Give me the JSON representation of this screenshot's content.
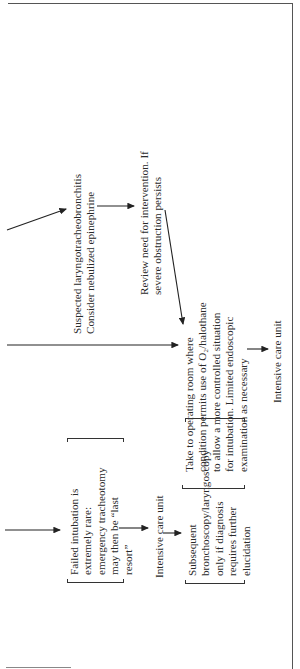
{
  "diagram": {
    "orientation": "rotated-90-ccw",
    "nodes": {
      "laryngo": {
        "lines": [
          "Suspected laryngotracheobronchitis",
          "Consider nebulized epinephrine"
        ]
      },
      "review": {
        "lines": [
          "Review need for intervention. If",
          "severe obstruction persists"
        ]
      },
      "operating_room": {
        "lines": [
          "Take to operating room where",
          "condition permits use of O₂/halothane",
          "to allow a more controlled situation",
          "for intubation. Limited endoscopic",
          "examination as necessary"
        ]
      },
      "icu_right": {
        "lines": [
          "Intensive care unit"
        ]
      },
      "failed_intubation": {
        "lines": [
          "Failed intubation is",
          "extremely rare:",
          "emergency tracheotomy",
          "may then be “last",
          "resort”"
        ]
      },
      "icu_left": {
        "lines": [
          "Intensive care unit"
        ]
      },
      "subsequent": {
        "lines": [
          "Subsequent",
          "bronchoscopy/laryngoscopy",
          "only if diagnosis",
          "requires further",
          "elucidation"
        ]
      }
    },
    "edges": [
      {
        "from": "offscreen-top",
        "to": "laryngo"
      },
      {
        "from": "laryngo",
        "to": "review"
      },
      {
        "from": "review",
        "to": "operating_room"
      },
      {
        "from": "offscreen-middle",
        "to": "operating_room"
      },
      {
        "from": "operating_room",
        "to": "icu_right"
      },
      {
        "from": "offscreen-bottom",
        "to": "failed_intubation"
      },
      {
        "from": "failed_intubation",
        "to": "icu_left"
      },
      {
        "from": "icu_left",
        "to": "subsequent"
      }
    ],
    "colors": {
      "ink": "#2a2a2a",
      "frame": "#555555",
      "background": "#ffffff"
    }
  }
}
